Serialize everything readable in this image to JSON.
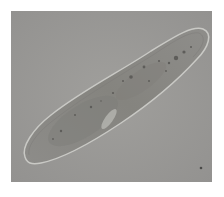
{
  "image": {
    "subject": "paramecium",
    "description": "Light-microscope photograph of a paramecium cell on a grey background",
    "background_color": "#9a9a98",
    "cell_fill": "#8f8e8b",
    "cell_outline": "#c8c8c4",
    "frame_color": "#ffffff"
  },
  "caption": {
    "text": ""
  }
}
